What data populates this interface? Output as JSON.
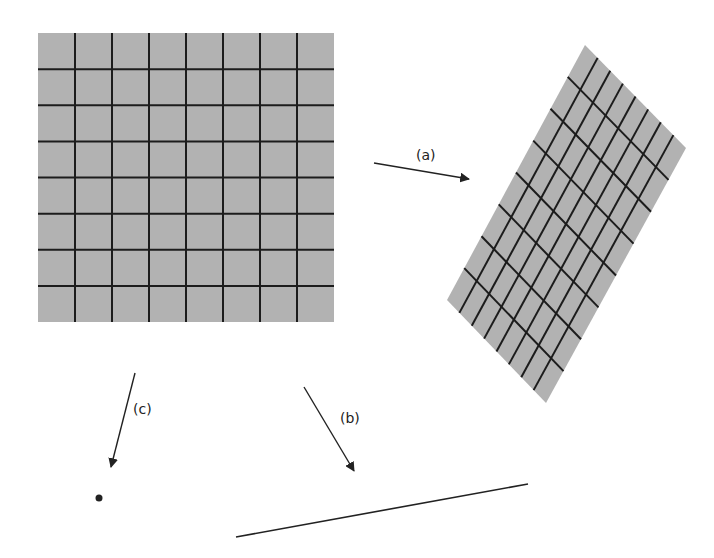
{
  "diagram": {
    "colors": {
      "fill": "#b2b2b2",
      "grid": "#1c1c1c",
      "ink": "#222222",
      "background": "#ffffff"
    },
    "square": {
      "x": 38,
      "y": 33,
      "width": 296,
      "height": 289,
      "divisions": 8
    },
    "parallelogram": {
      "top": [
        585,
        45
      ],
      "right": [
        686,
        148
      ],
      "bottom": [
        546,
        403
      ],
      "left": [
        447,
        300
      ],
      "divisions": 8
    },
    "arrows": [
      {
        "id": "a",
        "label": "(a)",
        "from": [
          374,
          163
        ],
        "to": [
          469,
          179
        ],
        "label_pos": [
          416,
          147
        ]
      },
      {
        "id": "b",
        "label": "(b)",
        "from": [
          304,
          387
        ],
        "to": [
          354,
          471
        ],
        "label_pos": [
          340,
          410
        ]
      },
      {
        "id": "c",
        "label": "(c)",
        "from": [
          135,
          373
        ],
        "to": [
          111,
          467
        ],
        "label_pos": [
          133,
          401
        ]
      }
    ],
    "point": {
      "cx": 99,
      "cy": 498,
      "r": 3.5
    },
    "segment": {
      "from": [
        236,
        537
      ],
      "to": [
        528,
        484
      ]
    }
  }
}
